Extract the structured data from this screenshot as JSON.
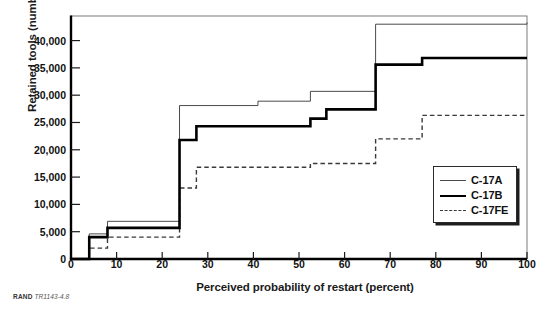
{
  "figure": {
    "credit_org": "RAND",
    "credit_code": "TR1143-4.8"
  },
  "legend": {
    "position": "inside-bottom-right",
    "items": [
      {
        "label": "C-17A",
        "style": "thin-solid",
        "color": "#4a4a4a"
      },
      {
        "label": "C-17B",
        "style": "thick-solid",
        "color": "#000000"
      },
      {
        "label": "C-17FE",
        "style": "dashed",
        "color": "#3a3a3a"
      }
    ]
  },
  "chart_data": {
    "type": "line",
    "subtype": "step-post",
    "title": "",
    "xlabel": "Perceived probability of restart (percent)",
    "ylabel": "Retained tools (number)",
    "xlim": [
      0,
      100
    ],
    "ylim": [
      0,
      44500
    ],
    "xticks": [
      0,
      10,
      20,
      30,
      40,
      50,
      60,
      70,
      80,
      90,
      100
    ],
    "yticks": [
      0,
      5000,
      10000,
      15000,
      20000,
      25000,
      30000,
      35000,
      40000
    ],
    "ytick_labels": [
      "0",
      "5,000",
      "10,000",
      "15,000",
      "20,000",
      "25,000",
      "30,000",
      "35,000",
      "40,000"
    ],
    "xtick_labels": [
      "0",
      "10",
      "20",
      "30",
      "40",
      "50",
      "60",
      "70",
      "80",
      "90",
      "100"
    ],
    "grid": false,
    "legend_position": "lower right",
    "series": [
      {
        "name": "C-17A",
        "style": "thin-solid",
        "color": "#4a4a4a",
        "linewidth": 1,
        "x": [
          0,
          4,
          4.5,
          8,
          8.5,
          23.8,
          27.5,
          41,
          52.5,
          56,
          66.8,
          77,
          100
        ],
        "y": [
          0,
          0,
          4600,
          4600,
          6900,
          6900,
          28100,
          28100,
          28900,
          28900,
          30700,
          43000,
          43300
        ],
        "points": [
          {
            "x": 0,
            "y": 0,
            "note": "origin"
          },
          {
            "x": 4,
            "y": 4600,
            "note": "first step"
          },
          {
            "x": 8,
            "y": 6900,
            "note": "second step"
          },
          {
            "x": 23.8,
            "y": 28100,
            "note": "major jump"
          },
          {
            "x": 41,
            "y": 28900,
            "note": "small step"
          },
          {
            "x": 52.5,
            "y": 30700,
            "note": "step"
          },
          {
            "x": 66.8,
            "y": 43000,
            "note": "large jump to plateau"
          },
          {
            "x": 100,
            "y": 43300,
            "note": "end"
          }
        ]
      },
      {
        "name": "C-17B",
        "style": "thick-solid",
        "color": "#000000",
        "linewidth": 2.6,
        "x": [
          0,
          4,
          4.5,
          8,
          8.5,
          23.8,
          27.5,
          41,
          52.5,
          56,
          66.8,
          77,
          100
        ],
        "y": [
          0,
          0,
          4000,
          4000,
          5700,
          5700,
          21800,
          21800,
          24300,
          24300,
          27400,
          35600,
          36800
        ],
        "points": [
          {
            "x": 0,
            "y": 0,
            "note": "origin"
          },
          {
            "x": 4,
            "y": 4000,
            "note": "first step"
          },
          {
            "x": 8,
            "y": 5700,
            "note": "second step"
          },
          {
            "x": 23.8,
            "y": 21800,
            "note": "major jump"
          },
          {
            "x": 27.5,
            "y": 24300,
            "note": "step"
          },
          {
            "x": 52.5,
            "y": 25700,
            "note": "step"
          },
          {
            "x": 56,
            "y": 27400,
            "note": "step"
          },
          {
            "x": 66.8,
            "y": 35600,
            "note": "large jump"
          },
          {
            "x": 77,
            "y": 36800,
            "note": "final plateau"
          },
          {
            "x": 100,
            "y": 36800,
            "note": "end"
          }
        ]
      },
      {
        "name": "C-17FE",
        "style": "dashed",
        "color": "#3a3a3a",
        "linewidth": 1.4,
        "x": [
          0,
          4,
          4.5,
          8,
          8.5,
          23.8,
          27.5,
          41,
          52.5,
          56,
          66.8,
          77,
          100
        ],
        "y": [
          0,
          0,
          2000,
          2000,
          4000,
          4000,
          13000,
          16800,
          16800,
          17500,
          17500,
          22000,
          26300
        ],
        "points": [
          {
            "x": 0,
            "y": 0,
            "note": "origin"
          },
          {
            "x": 4,
            "y": 2000,
            "note": "first step"
          },
          {
            "x": 8,
            "y": 4000,
            "note": "second step"
          },
          {
            "x": 23.8,
            "y": 13000,
            "note": "jump"
          },
          {
            "x": 27.5,
            "y": 16800,
            "note": "step"
          },
          {
            "x": 52.5,
            "y": 17500,
            "note": "step"
          },
          {
            "x": 66.8,
            "y": 22000,
            "note": "step"
          },
          {
            "x": 77,
            "y": 26300,
            "note": "final plateau"
          },
          {
            "x": 100,
            "y": 26300,
            "note": "end"
          }
        ]
      }
    ]
  }
}
